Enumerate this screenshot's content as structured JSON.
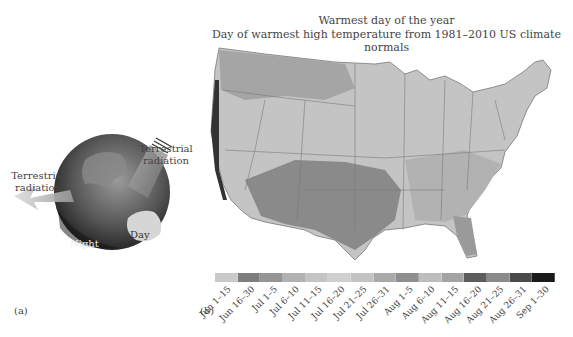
{
  "panel_a": {
    "label": "(a)",
    "arrow_left_label_line1": "Terrestrial",
    "arrow_left_label_line2": "radiation",
    "arrow_right_label_line1": "Terrestrial",
    "arrow_right_label_line2": "radiation",
    "night_label": "Night",
    "day_label": "Day"
  },
  "panel_b": {
    "label": "(b)",
    "title": "Warmest day of the year",
    "subtitle": "Day of warmest high temperature from 1981–2010 US climate normals",
    "legend": [
      {
        "label": "Jun 1–15",
        "color": "#c9c9c9"
      },
      {
        "label": "Jun 16–30",
        "color": "#7d7d7d"
      },
      {
        "label": "Jul 1–5",
        "color": "#959595"
      },
      {
        "label": "Jul 6–10",
        "color": "#b1b1b1"
      },
      {
        "label": "Jul 11–15",
        "color": "#c4c4c4"
      },
      {
        "label": "Jul 16–20",
        "color": "#cfcfcf"
      },
      {
        "label": "Jul 21–25",
        "color": "#c2c2c2"
      },
      {
        "label": "Jul 26–31",
        "color": "#a9a9a9"
      },
      {
        "label": "Aug 1–5",
        "color": "#8f8f8f"
      },
      {
        "label": "Aug 6–10",
        "color": "#bdbdbd"
      },
      {
        "label": "Aug 11–15",
        "color": "#a3a3a3"
      },
      {
        "label": "Aug 16–20",
        "color": "#5c5c5c"
      },
      {
        "label": "Aug 21–25",
        "color": "#8a8a8a"
      },
      {
        "label": "Aug 26–31",
        "color": "#4a4a4a"
      },
      {
        "label": "Sep 1–30",
        "color": "#1a1a1a"
      }
    ]
  }
}
